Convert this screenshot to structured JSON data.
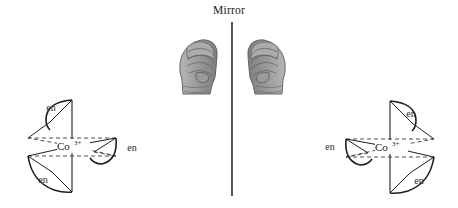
{
  "figure": {
    "title": "Mirror",
    "background_color": "#ffffff",
    "line_color": "#1f1f1f",
    "dashed_color": "#3a3a3a",
    "hand_fill": "#9a9a9a",
    "hand_outline": "#5a5a5a"
  },
  "mirror": {
    "label": "Mirror",
    "x": 232,
    "y_top": 22,
    "y_bottom": 196,
    "stroke_width": 1.6,
    "color": "#2b2b2b"
  },
  "hands": [
    {
      "name": "left-hand",
      "side": "left",
      "cx": 197,
      "cy": 63,
      "mirrored": false
    },
    {
      "name": "right-hand",
      "side": "right",
      "cx": 268,
      "cy": 63,
      "mirrored": true
    }
  ],
  "complexes": [
    {
      "name": "left-complex",
      "side": "left",
      "center_label": "Co",
      "charge_label": "3+",
      "center_x": 72,
      "center_y": 146,
      "chirality": "delta",
      "ligand_labels": [
        {
          "text": "en",
          "x": 51,
          "y": 111
        },
        {
          "text": "en",
          "x": 132,
          "y": 151
        },
        {
          "text": "en",
          "x": 43,
          "y": 183
        }
      ]
    },
    {
      "name": "right-complex",
      "side": "right",
      "center_label": "Co",
      "charge_label": "3+",
      "center_x": 390,
      "center_y": 147,
      "chirality": "lambda",
      "ligand_labels": [
        {
          "text": "en",
          "x": 411,
          "y": 117
        },
        {
          "text": "en",
          "x": 330,
          "y": 150
        },
        {
          "text": "en",
          "x": 419,
          "y": 184
        }
      ]
    }
  ],
  "legend": {
    "ligand_abbreviation": "en",
    "ligand_full_name": "ethylenediamine",
    "metal_symbol": "Co",
    "metal_oxidation_state": "3+"
  }
}
